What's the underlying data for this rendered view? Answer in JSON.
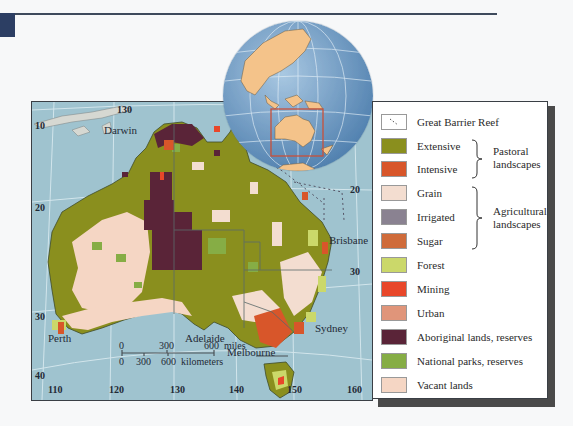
{
  "header": {
    "rule_color": "#3e4a5c",
    "corner_block_color": "#2c3e63"
  },
  "map": {
    "ocean_color": "#9fc3cf",
    "cities": [
      {
        "name": "Darwin",
        "x": 72,
        "y": 24
      },
      {
        "name": "Brisbane",
        "x": 297,
        "y": 134
      },
      {
        "name": "Perth",
        "x": 16,
        "y": 232
      },
      {
        "name": "Adelaide",
        "x": 153,
        "y": 232
      },
      {
        "name": "Melbourne",
        "x": 195,
        "y": 246
      },
      {
        "name": "Sydney",
        "x": 283,
        "y": 222
      },
      {
        "name": "Hobart",
        "x": 254,
        "y": 306
      }
    ],
    "longitude_ticks": [
      {
        "label": "110",
        "x": 16
      },
      {
        "label": "120",
        "x": 77
      },
      {
        "label": "130",
        "x": 138
      },
      {
        "label": "140",
        "x": 197
      },
      {
        "label": "150",
        "x": 255
      },
      {
        "label": "160",
        "x": 315
      }
    ],
    "top_longitude_tick": {
      "label": "130",
      "x": 85
    },
    "latitude_ticks": [
      {
        "label": "10",
        "x": 3,
        "y": 20
      },
      {
        "label": "20",
        "x": 3,
        "y": 99
      },
      {
        "label": "30",
        "x": 3,
        "y": 210
      },
      {
        "label": "40",
        "x": 3,
        "y": 270
      },
      {
        "label": "20",
        "x": 318,
        "y": 85
      },
      {
        "label": "30",
        "x": 318,
        "y": 166
      }
    ],
    "scale_bar": {
      "miles_ticks": [
        "0",
        "300",
        "600"
      ],
      "miles_unit": "miles",
      "km_ticks": [
        "0",
        "300",
        "600"
      ],
      "km_unit": "kilometers"
    }
  },
  "inset_globe": {
    "ocean_color": "#6f9fc9",
    "land_color": "#f4c38a",
    "highlight_box_color": "#c8503a"
  },
  "legend": {
    "items": [
      {
        "label": "Great Barrier Reef",
        "color": "#ffffff",
        "type": "reef"
      },
      {
        "label": "Extensive",
        "color": "#8a8f1e"
      },
      {
        "label": "Intensive",
        "color": "#d8562a"
      },
      {
        "label": "Grain",
        "color": "#f3ddd0"
      },
      {
        "label": "Irrigated",
        "color": "#8a8291"
      },
      {
        "label": "Sugar",
        "color": "#cf6b3a"
      },
      {
        "label": "Forest",
        "color": "#cbd86a"
      },
      {
        "label": "Mining",
        "color": "#e8472a"
      },
      {
        "label": "Urban",
        "color": "#e0957a"
      },
      {
        "label": "Aboriginal lands, reserves",
        "color": "#5a2438"
      },
      {
        "label": "National parks, reserves",
        "color": "#86ad45"
      },
      {
        "label": "Vacant lands",
        "color": "#f5d6c4"
      }
    ],
    "groups": [
      {
        "line1": "Pastoral",
        "line2": "landscapes"
      },
      {
        "line1": "Agricultural",
        "line2": "landscapes"
      }
    ]
  }
}
